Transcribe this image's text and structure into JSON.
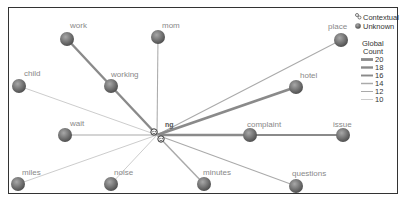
{
  "diagram": {
    "hub": {
      "label": "ng",
      "x": 157,
      "y": 135
    },
    "nodes": [
      {
        "id": "work",
        "label": "work",
        "x": 67,
        "y": 39,
        "lx": 70,
        "ly": 28,
        "weight": 18
      },
      {
        "id": "mom",
        "label": "mom",
        "x": 158,
        "y": 37,
        "lx": 162,
        "ly": 28,
        "weight": 12
      },
      {
        "id": "place",
        "label": "place",
        "x": 341,
        "y": 40,
        "lx": 328,
        "ly": 29,
        "weight": 12
      },
      {
        "id": "child",
        "label": "child",
        "x": 19,
        "y": 86,
        "lx": 24,
        "ly": 76,
        "weight": 10
      },
      {
        "id": "working",
        "label": "working",
        "x": 111,
        "y": 86,
        "lx": 111,
        "ly": 77,
        "weight": 18
      },
      {
        "id": "hotel",
        "label": "hotel",
        "x": 296,
        "y": 87,
        "lx": 300,
        "ly": 78,
        "weight": 20
      },
      {
        "id": "wait",
        "label": "wait",
        "x": 65,
        "y": 135,
        "lx": 70,
        "ly": 126,
        "weight": 12
      },
      {
        "id": "complaint",
        "label": "complaint",
        "x": 250,
        "y": 135,
        "lx": 247,
        "ly": 127,
        "weight": 18
      },
      {
        "id": "issue",
        "label": "issue",
        "x": 343,
        "y": 135,
        "lx": 333,
        "ly": 127,
        "weight": 16
      },
      {
        "id": "miles",
        "label": "miles",
        "x": 18,
        "y": 184,
        "lx": 22,
        "ly": 175,
        "weight": 10
      },
      {
        "id": "noise",
        "label": "noise",
        "x": 111,
        "y": 184,
        "lx": 114,
        "ly": 175,
        "weight": 10
      },
      {
        "id": "minutes",
        "label": "minutes",
        "x": 204,
        "y": 184,
        "lx": 203,
        "ly": 175,
        "weight": 14
      },
      {
        "id": "questions",
        "label": "questions",
        "x": 296,
        "y": 186,
        "lx": 292,
        "ly": 176,
        "weight": 12
      }
    ],
    "edges": [
      {
        "from": "hub",
        "to": "work",
        "via": "working",
        "weight": 18
      },
      {
        "from": "hub",
        "to": "mom",
        "weight": 12
      },
      {
        "from": "hub",
        "to": "place",
        "weight": 12
      },
      {
        "from": "hub",
        "to": "child",
        "weight": 10
      },
      {
        "from": "hub",
        "to": "hotel",
        "weight": 20
      },
      {
        "from": "hub",
        "to": "wait",
        "weight": 12
      },
      {
        "from": "hub",
        "to": "complaint",
        "weight": 18
      },
      {
        "from": "complaint",
        "to": "issue",
        "weight": 16
      },
      {
        "from": "hub",
        "to": "miles",
        "weight": 10
      },
      {
        "from": "hub",
        "to": "noise",
        "weight": 10
      },
      {
        "from": "hub",
        "to": "minutes",
        "weight": 14
      },
      {
        "from": "hub",
        "to": "questions",
        "weight": 12
      }
    ]
  },
  "legend": {
    "types": [
      {
        "label": "Contextual",
        "icon": "contextual-icon"
      },
      {
        "label": "Unknown",
        "icon": "unknown-node-icon"
      }
    ],
    "count_title_line1": "Global",
    "count_title_line2": "Count",
    "counts": [
      "20",
      "18",
      "16",
      "14",
      "12",
      "10"
    ]
  },
  "colors": {
    "edge": "#999999",
    "node_dark": "#555555",
    "node_light": "#9a9a9a",
    "frame": "#333333"
  }
}
